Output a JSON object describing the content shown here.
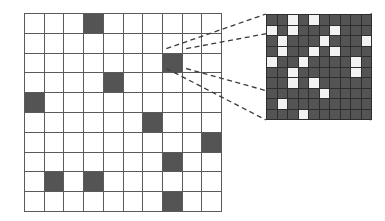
{
  "figure": {
    "title": "",
    "colors": {
      "cell_fill": "#545454",
      "cell_empty": "#ffffff",
      "grid_line": "#5a5a5a",
      "inset_background": "#545454",
      "inset_cell_on": "#f2f2f2",
      "inset_grid_line": "#2e2e2e",
      "connector_line": "#3a3a3a",
      "page_background": "#ffffff"
    }
  },
  "main_grid": {
    "label": "coarse-grid",
    "rows": 10,
    "cols": 10,
    "cells": [
      [
        0,
        0,
        0,
        1,
        0,
        0,
        0,
        0,
        0,
        0
      ],
      [
        0,
        0,
        0,
        0,
        0,
        0,
        0,
        0,
        0,
        0
      ],
      [
        0,
        0,
        0,
        0,
        0,
        0,
        0,
        1,
        0,
        0
      ],
      [
        0,
        0,
        0,
        0,
        1,
        0,
        0,
        0,
        0,
        0
      ],
      [
        1,
        0,
        0,
        0,
        0,
        0,
        0,
        0,
        0,
        0
      ],
      [
        0,
        0,
        0,
        0,
        0,
        0,
        1,
        0,
        0,
        0
      ],
      [
        0,
        0,
        0,
        0,
        0,
        0,
        0,
        0,
        0,
        1
      ],
      [
        0,
        0,
        0,
        0,
        0,
        0,
        0,
        1,
        0,
        0
      ],
      [
        0,
        1,
        0,
        1,
        0,
        0,
        0,
        0,
        0,
        0
      ],
      [
        0,
        0,
        0,
        0,
        0,
        0,
        0,
        1,
        0,
        0
      ]
    ],
    "highlighted_cell": {
      "row": 2,
      "col": 7
    }
  },
  "inset_grid": {
    "label": "magnified-grid",
    "rows": 10,
    "cols": 10,
    "cells": [
      [
        0,
        0,
        1,
        0,
        1,
        0,
        0,
        0,
        0,
        0
      ],
      [
        1,
        0,
        1,
        0,
        0,
        0,
        1,
        0,
        0,
        0
      ],
      [
        0,
        1,
        0,
        0,
        0,
        1,
        0,
        0,
        0,
        1
      ],
      [
        0,
        1,
        0,
        0,
        1,
        0,
        1,
        0,
        0,
        0
      ],
      [
        1,
        0,
        0,
        1,
        0,
        0,
        0,
        0,
        1,
        0
      ],
      [
        0,
        0,
        1,
        0,
        0,
        0,
        0,
        0,
        1,
        0
      ],
      [
        0,
        0,
        1,
        0,
        1,
        0,
        0,
        0,
        0,
        0
      ],
      [
        0,
        0,
        0,
        0,
        0,
        1,
        0,
        0,
        0,
        0
      ],
      [
        0,
        1,
        0,
        0,
        0,
        0,
        0,
        0,
        0,
        0
      ],
      [
        0,
        0,
        0,
        1,
        0,
        0,
        0,
        0,
        0,
        0
      ]
    ]
  },
  "connectors": {
    "label": "magnifier-leader-lines",
    "count": 4,
    "style": "dashed",
    "from_cell": {
      "row": 2,
      "col": 7
    },
    "lines": [
      {
        "x1": 166.4,
        "y1": 48.6,
        "x2": 266,
        "y2": 14
      },
      {
        "x1": 186.2,
        "y1": 48.6,
        "x2": 372,
        "y2": 14
      },
      {
        "x1": 166.4,
        "y1": 68.5,
        "x2": 266,
        "y2": 120
      },
      {
        "x1": 186.2,
        "y1": 68.5,
        "x2": 372,
        "y2": 120
      }
    ]
  }
}
